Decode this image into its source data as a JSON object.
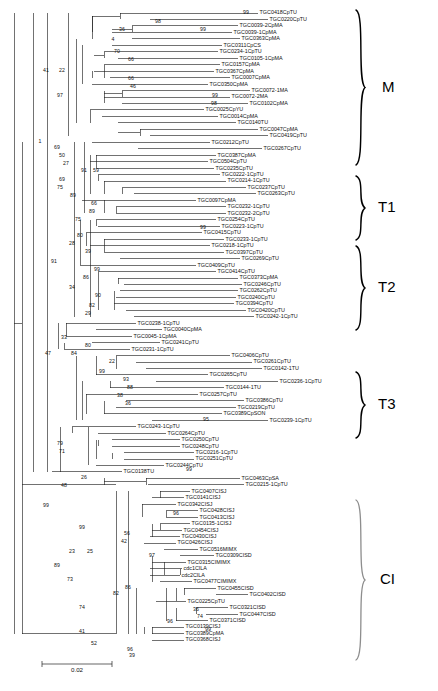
{
  "figure": {
    "type": "phylogenetic-tree",
    "scale_bar": {
      "label": "0.02",
      "value": 0.02
    }
  },
  "groups": [
    {
      "id": "M",
      "label": "M"
    },
    {
      "id": "T1",
      "label": "T1"
    },
    {
      "id": "T2",
      "label": "T2"
    },
    {
      "id": "T3",
      "label": "T3"
    },
    {
      "id": "CI",
      "label": "CI"
    }
  ],
  "tips": [
    {
      "label": "TGC0418CpTU",
      "group": "M"
    },
    {
      "label": "TGC0220CpTU",
      "group": "M"
    },
    {
      "label": "TGC0039-2CpMA",
      "group": "M"
    },
    {
      "label": "TGC0039-1CpMA",
      "group": "M"
    },
    {
      "label": "TGC0363CpMA",
      "group": "M"
    },
    {
      "label": "TGC0311CpCS",
      "group": "M"
    },
    {
      "label": "TGC0234-1CpTU",
      "group": "M"
    },
    {
      "label": "TGC0105-1CpMA",
      "group": "M"
    },
    {
      "label": "TGC0157CpMA",
      "group": "M"
    },
    {
      "label": "TGC0367CpMA",
      "group": "M"
    },
    {
      "label": "TGC0007CpMA",
      "group": "M"
    },
    {
      "label": "TGC0350CpMA",
      "group": "M"
    },
    {
      "label": "TGC0072-1MA",
      "group": "M"
    },
    {
      "label": "TGC0072-2MA",
      "group": "M"
    },
    {
      "label": "TGC0102CpMA",
      "group": "M"
    },
    {
      "label": "TGC0025CpYU",
      "group": "M"
    },
    {
      "label": "TGC0014CpMA",
      "group": "M"
    },
    {
      "label": "TGC0140TU",
      "group": "M"
    },
    {
      "label": "TGC0047CpMA",
      "group": "M"
    },
    {
      "label": "TGC0419CpTU",
      "group": "M"
    },
    {
      "label": "TGC0212CpTU",
      "group": "T1"
    },
    {
      "label": "TGC0267CpTU",
      "group": "T1"
    },
    {
      "label": "TGC0387CpMA",
      "group": "T1"
    },
    {
      "label": "TGC0504CpTU",
      "group": "T1"
    },
    {
      "label": "TGC0235CpTU",
      "group": "T1"
    },
    {
      "label": "TGC0222-1CpTU",
      "group": "T1"
    },
    {
      "label": "TGC0214-1CpTU",
      "group": "T1"
    },
    {
      "label": "TGC0237CpTU",
      "group": "T1"
    },
    {
      "label": "TGC0263CpTU",
      "group": "T1"
    },
    {
      "label": "TGC0097CpMA",
      "group": "T1"
    },
    {
      "label": "TGC0232-1CpTU",
      "group": "T1"
    },
    {
      "label": "TGC0232-2CpTU",
      "group": "T1"
    },
    {
      "label": "TGC0254CpTU",
      "group": "T2"
    },
    {
      "label": "TGC0223-1CpTU",
      "group": "T2"
    },
    {
      "label": "TGC0415CpTU",
      "group": "T2"
    },
    {
      "label": "TGC0233-1CpTU",
      "group": "T2"
    },
    {
      "label": "TGC0218-1CpTU",
      "group": "T2"
    },
    {
      "label": "TGC0397CpTU",
      "group": "T2"
    },
    {
      "label": "TGC0269CpTU",
      "group": "T2"
    },
    {
      "label": "TGC0409CpTU",
      "group": "T2"
    },
    {
      "label": "TGC0414CpTU",
      "group": "T2"
    },
    {
      "label": "TGC0373CpMA",
      "group": "T2"
    },
    {
      "label": "TGC0246CpTU",
      "group": "T2"
    },
    {
      "label": "TGC0262CpTU",
      "group": "T2"
    },
    {
      "label": "TGC0240CpTU",
      "group": "T2"
    },
    {
      "label": "TGC0394CpTU",
      "group": "T2"
    },
    {
      "label": "TGC0420CpTU",
      "group": "T2"
    },
    {
      "label": "TGC0242-1CpTU",
      "group": "T2"
    },
    {
      "label": "TGC0238-1CpTU",
      "group": ""
    },
    {
      "label": "TGC0040CpMA",
      "group": ""
    },
    {
      "label": "TGC0045-1CpMA",
      "group": ""
    },
    {
      "label": "TGC0241CpTU",
      "group": ""
    },
    {
      "label": "TGC0231-1CpTU",
      "group": ""
    },
    {
      "label": "TGC0406CpTU",
      "group": "T3"
    },
    {
      "label": "TGC0261CpTU",
      "group": "T3"
    },
    {
      "label": "TGC0142-1TU",
      "group": "T3"
    },
    {
      "label": "TGC0265CpTU",
      "group": "T3"
    },
    {
      "label": "TGC0236-1CpTU",
      "group": "T3"
    },
    {
      "label": "TGC0144-1TU",
      "group": "T3"
    },
    {
      "label": "TGC0257CpTU",
      "group": "T3"
    },
    {
      "label": "TGC0386CpTU",
      "group": "T3"
    },
    {
      "label": "TGC0219CpTU",
      "group": "T3"
    },
    {
      "label": "TGC0389CpSON",
      "group": "T3"
    },
    {
      "label": "TGC0239-1CpTU",
      "group": "T3"
    },
    {
      "label": "TGC0243-1CpTU",
      "group": ""
    },
    {
      "label": "TGC0264CpTU",
      "group": ""
    },
    {
      "label": "TGC0250CpTU",
      "group": ""
    },
    {
      "label": "TGC0248CpTU",
      "group": ""
    },
    {
      "label": "TGC0216-1CpTU",
      "group": ""
    },
    {
      "label": "TGC0251CpTU",
      "group": ""
    },
    {
      "label": "TGC0244CpTU",
      "group": ""
    },
    {
      "label": "TGC0138TU",
      "group": ""
    },
    {
      "label": "TGC0463CpSA",
      "group": ""
    },
    {
      "label": "TGC0215-1CpTU",
      "group": ""
    },
    {
      "label": "TGC0407CISJ",
      "group": "CI"
    },
    {
      "label": "TGC0141CISJ",
      "group": "CI"
    },
    {
      "label": "TGC0342CISJ",
      "group": "CI"
    },
    {
      "label": "TGC0428CISJ",
      "group": "CI"
    },
    {
      "label": "TGC0413CISJ",
      "group": "CI"
    },
    {
      "label": "TGC0135-1CISJ",
      "group": "CI"
    },
    {
      "label": "TGC0454CISJ",
      "group": "CI"
    },
    {
      "label": "TGC0430CISJ",
      "group": "CI"
    },
    {
      "label": "TGC0426CISJ",
      "group": "CI"
    },
    {
      "label": "TGC0516MIMX",
      "group": "CI"
    },
    {
      "label": "TGC0309CISD",
      "group": "CI"
    },
    {
      "label": "TGC0315CIMIMX",
      "group": "CI"
    },
    {
      "label": "cdc1CILA",
      "group": "CI"
    },
    {
      "label": "cdc2CILA",
      "group": "CI"
    },
    {
      "label": "TGC0477CIMIMX",
      "group": "CI"
    },
    {
      "label": "TGC0455CISD",
      "group": "CI"
    },
    {
      "label": "TGC0402CISD",
      "group": "CI"
    },
    {
      "label": "TGC0225CpTU",
      "group": "CI"
    },
    {
      "label": "TGC0321CISD",
      "group": "CI"
    },
    {
      "label": "TGC0447CISD",
      "group": "CI"
    },
    {
      "label": "TGC0371CISD",
      "group": "CI"
    },
    {
      "label": "TGC0139CISJ",
      "group": "CI"
    },
    {
      "label": "TGC0389CpMA",
      "group": "CI"
    },
    {
      "label": "TGC0368CISJ",
      "group": "CI"
    }
  ],
  "bootstrap_values": [
    "99",
    "98",
    "99",
    "36",
    "4",
    "70",
    "66",
    "41",
    "22",
    "66",
    "46",
    "97",
    "99",
    "98",
    "1",
    "69",
    "50",
    "27",
    "91",
    "59",
    "69",
    "75",
    "89",
    "66",
    "89",
    "75",
    "99",
    "80",
    "28",
    "39",
    "91",
    "99",
    "86",
    "34",
    "90",
    "82",
    "29",
    "33",
    "80",
    "47",
    "84",
    "22",
    "99",
    "93",
    "88",
    "38",
    "36",
    "95",
    "79",
    "71",
    "99",
    "26",
    "48",
    "99",
    "96",
    "99",
    "56",
    "42",
    "23",
    "25",
    "97",
    "89",
    "73",
    "86",
    "82",
    "74",
    "36",
    "74",
    "96",
    "41",
    "99",
    "52",
    "96",
    "39"
  ],
  "tree_metrics": {
    "tip_count": 97,
    "root_x": 14,
    "tip_label_x_min": 150,
    "tip_label_x_max": 404
  }
}
